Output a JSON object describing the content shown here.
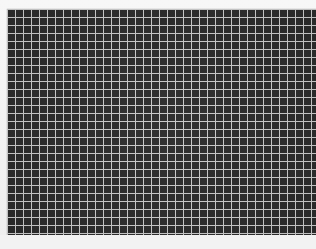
{
  "image": {
    "description": "Dark grid pattern of square cells with light gray lines on a light background",
    "grid": {
      "columns": 39,
      "rows": 28,
      "cell_pitch_px": 8,
      "cell_fill_color": "#2b2b2b",
      "line_color": "#c9c9c9",
      "background_color": "#f4f4f4"
    }
  }
}
